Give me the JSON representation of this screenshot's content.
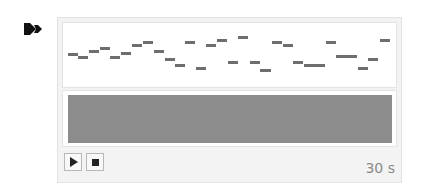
{
  "logo": {
    "icon": "double-arrow-icon"
  },
  "piano_roll": {
    "note_color": "#6e6e6e",
    "notes": [
      {
        "x": 68,
        "y": 54,
        "w": 10
      },
      {
        "x": 78,
        "y": 57,
        "w": 10
      },
      {
        "x": 89,
        "y": 51,
        "w": 10
      },
      {
        "x": 100,
        "y": 48,
        "w": 10
      },
      {
        "x": 110,
        "y": 57,
        "w": 10
      },
      {
        "x": 121,
        "y": 53,
        "w": 10
      },
      {
        "x": 132,
        "y": 45,
        "w": 10
      },
      {
        "x": 143,
        "y": 42,
        "w": 10
      },
      {
        "x": 154,
        "y": 51,
        "w": 10
      },
      {
        "x": 165,
        "y": 59,
        "w": 10
      },
      {
        "x": 175,
        "y": 65,
        "w": 10
      },
      {
        "x": 185,
        "y": 42,
        "w": 10
      },
      {
        "x": 196,
        "y": 68,
        "w": 10
      },
      {
        "x": 206,
        "y": 45,
        "w": 10
      },
      {
        "x": 217,
        "y": 40,
        "w": 10
      },
      {
        "x": 228,
        "y": 62,
        "w": 10
      },
      {
        "x": 238,
        "y": 37,
        "w": 10
      },
      {
        "x": 250,
        "y": 62,
        "w": 10
      },
      {
        "x": 260,
        "y": 70,
        "w": 11
      },
      {
        "x": 272,
        "y": 42,
        "w": 10
      },
      {
        "x": 283,
        "y": 45,
        "w": 10
      },
      {
        "x": 293,
        "y": 62,
        "w": 10
      },
      {
        "x": 304,
        "y": 65,
        "w": 21
      },
      {
        "x": 326,
        "y": 42,
        "w": 10
      },
      {
        "x": 336,
        "y": 56,
        "w": 21
      },
      {
        "x": 358,
        "y": 68,
        "w": 10
      },
      {
        "x": 368,
        "y": 59,
        "w": 10
      },
      {
        "x": 380,
        "y": 40,
        "w": 10
      }
    ]
  },
  "waveform": {
    "color": "#8c8c8c"
  },
  "controls": {
    "play_icon": "play-icon",
    "stop_icon": "stop-icon",
    "duration": "30 s"
  }
}
